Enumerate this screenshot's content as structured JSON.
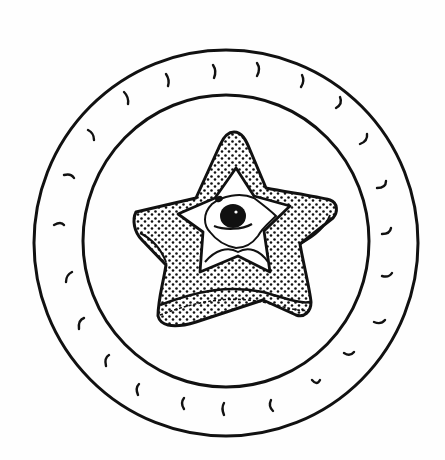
{
  "illustration": {
    "subject": "Star-shaped toast with fried egg on a plate",
    "style": "black ink line drawing with stippled toast",
    "colors": {
      "ink": "#111111",
      "paper": "#fefefe"
    },
    "plate": {
      "outer_rim": {
        "cx": 226,
        "cy": 243,
        "rx": 192,
        "ry": 193
      },
      "inner_well": {
        "cx": 226,
        "cy": 241,
        "rx": 143,
        "ry": 146
      },
      "rim_decoration": "small curved tick marks around the rim"
    },
    "toast": {
      "shape": "five-point star",
      "texture": "stippled dots",
      "center": [
        232,
        248
      ]
    },
    "egg": {
      "white_shape": "star-shaped",
      "yolk": {
        "cx": 233,
        "cy": 216,
        "r": 12
      }
    }
  }
}
